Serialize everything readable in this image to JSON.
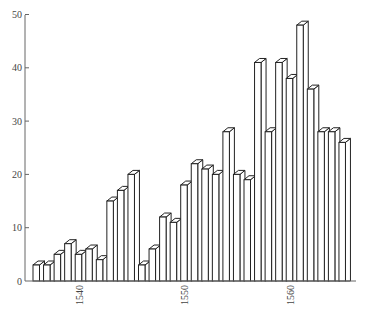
{
  "chart_data": {
    "type": "bar",
    "style": "3d-outline",
    "title": "",
    "xlabel": "",
    "ylabel": "",
    "ylim": [
      0,
      50
    ],
    "yticks": [
      0,
      10,
      20,
      30,
      40,
      50
    ],
    "xtick_labels": [
      "1540",
      "1550",
      "1560"
    ],
    "grid": false,
    "legend": null,
    "categories": [
      1536,
      1537,
      1538,
      1539,
      1540,
      1541,
      1542,
      1543,
      1544,
      1545,
      1546,
      1547,
      1548,
      1549,
      1550,
      1551,
      1552,
      1553,
      1554,
      1555,
      1556,
      1557,
      1558,
      1559,
      1560,
      1561,
      1562,
      1563,
      1564,
      1565
    ],
    "values": [
      3,
      3,
      5,
      7,
      5,
      6,
      4,
      15,
      17,
      20,
      3,
      6,
      12,
      11,
      18,
      22,
      21,
      20,
      28,
      20,
      19,
      41,
      28,
      41,
      38,
      48,
      36,
      28,
      28,
      26
    ]
  },
  "colors": {
    "bar_fill": "#ffffff",
    "bar_stroke": "#222222",
    "axis": "#666666",
    "text": "#444444"
  }
}
